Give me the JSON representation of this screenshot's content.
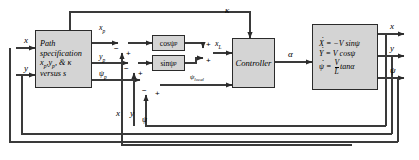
{
  "diagram": {
    "width": 419,
    "height": 160,
    "background": "#ffffff",
    "block_fill": "#d4d4d4",
    "line_color": "#3a3a3a"
  },
  "blocks": {
    "path_spec": {
      "name": "path-specification-block",
      "line1": "Path",
      "line2": "specification",
      "line3_a": "x",
      "line3_sub1": "p",
      "line3_b": ",y",
      "line3_sub2": "p",
      "line3_c": ", & κ",
      "line4": "versus s"
    },
    "cos_block": {
      "name": "cos-psi-p-block",
      "label_main": "cosψ",
      "label_sub": "p"
    },
    "sin_block": {
      "name": "sin-psi-p-block",
      "label_main": "sinψ",
      "label_sub": "p"
    },
    "controller": {
      "name": "controller-block",
      "label": "Controller"
    },
    "plant": {
      "name": "vehicle-kinematics-block",
      "eq1_lhs": "X",
      "eq1_rhs": "= −V sinψ",
      "eq2_lhs": "Y",
      "eq2_rhs": "= V cosψ",
      "eq3_lhs": "ψ",
      "eq3_eq": "=",
      "eq3_num": "V",
      "eq3_den": "L",
      "eq3_tail": "tanα"
    }
  },
  "signals": {
    "input_x": "x",
    "input_y": "y",
    "x_p_main": "x",
    "x_p_sub": "p",
    "y_p_main": "y",
    "y_p_sub": "p",
    "psi_p_main": "ψ",
    "psi_p_sub": "p",
    "kappa": "κ",
    "x_L_main": "x",
    "x_L_sub": "L",
    "psi_local_main": "ψ",
    "psi_local_sub": "local",
    "alpha": "α",
    "feedback_x": "x",
    "feedback_y": "y",
    "feedback_psi": "ψ",
    "output_x": "x",
    "output_y": "y",
    "output_psi": "ψ"
  },
  "signs": {
    "sum1_minus": "−",
    "sum1_plus": "+",
    "sum2_minus": "−",
    "sum2_plus": "+",
    "sum3_minus": "−",
    "sum3_plus": "+",
    "sum4_plus_top": "+",
    "sum4_plus_bottom": "+"
  },
  "junctions": {
    "sum_x": "summing-junction-x",
    "sum_y": "summing-junction-y",
    "sum_psi": "summing-junction-psi",
    "sum_xL": "summing-junction-xL"
  }
}
